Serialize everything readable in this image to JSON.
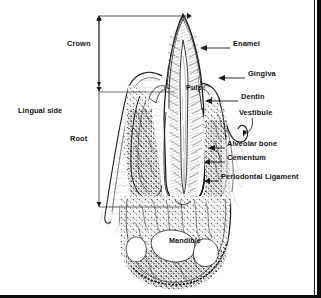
{
  "figure": {
    "type": "anatomical-diagram",
    "width": 321,
    "height": 298,
    "background_color": "#ffffff",
    "ink_color": "#1a1a1a"
  },
  "side_label": {
    "text": "Lingual side",
    "x": 18,
    "y": 112
  },
  "dimensions": [
    {
      "name": "crown",
      "label": "Crown",
      "label_x": 67,
      "label_y": 45,
      "bracket_x": 99,
      "top_y": 17,
      "bottom_y": 92
    },
    {
      "name": "root",
      "label": "Root",
      "label_x": 70,
      "label_y": 140,
      "bracket_x": 99,
      "top_y": 92,
      "bottom_y": 207
    }
  ],
  "callouts": [
    {
      "name": "enamel",
      "label": "Enamel",
      "label_x": 233,
      "label_y": 44,
      "line_x1": 230,
      "line_y1": 48,
      "arrow_x": 202,
      "arrow_y": 48
    },
    {
      "name": "gingiva",
      "label": "Gingiva",
      "label_x": 248,
      "label_y": 74,
      "line_x1": 245,
      "line_y1": 78,
      "arrow_x": 222,
      "arrow_y": 78
    },
    {
      "name": "dentin",
      "label": "Dentin",
      "label_x": 241,
      "label_y": 97,
      "line_x1": 238,
      "line_y1": 101,
      "arrow_x": 207,
      "arrow_y": 101
    },
    {
      "name": "vestibule",
      "label": "Vestibule",
      "label_x": 239,
      "label_y": 113,
      "line_x1": 252,
      "line_y1": 118,
      "arrow_x": 246,
      "arrow_y": 130
    },
    {
      "name": "alveolar-bone",
      "label": "Alveolar bone",
      "label_x": 227,
      "label_y": 144,
      "line_x1": 225,
      "line_y1": 148,
      "arrow_x": 211,
      "arrow_y": 148
    },
    {
      "name": "cementum",
      "label": "Cementum",
      "label_x": 227,
      "label_y": 158,
      "line_x1": 225,
      "line_y1": 162,
      "arrow_x": 206,
      "arrow_y": 162
    },
    {
      "name": "periodontal-ligament",
      "label": "Periodontal Ligament",
      "label_x": 221,
      "label_y": 177,
      "line_x1": 219,
      "line_y1": 181,
      "arrow_x": 206,
      "arrow_y": 181
    }
  ],
  "inline_labels": [
    {
      "name": "pulp",
      "label": "Pulp",
      "x": 186,
      "y": 88
    },
    {
      "name": "mandible",
      "label": "Mandible",
      "x": 169,
      "y": 241
    }
  ]
}
